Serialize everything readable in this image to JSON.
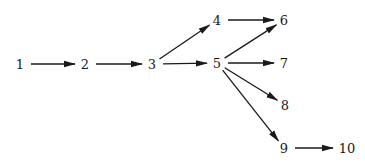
{
  "diagram": {
    "type": "directed-graph",
    "nodes": [
      {
        "id": "1",
        "label": "1",
        "x": 20,
        "y": 64
      },
      {
        "id": "2",
        "label": "2",
        "x": 85,
        "y": 64
      },
      {
        "id": "3",
        "label": "3",
        "x": 152,
        "y": 64
      },
      {
        "id": "4",
        "label": "4",
        "x": 217,
        "y": 20
      },
      {
        "id": "5",
        "label": "5",
        "x": 217,
        "y": 63
      },
      {
        "id": "6",
        "label": "6",
        "x": 284,
        "y": 20
      },
      {
        "id": "7",
        "label": "7",
        "x": 284,
        "y": 63
      },
      {
        "id": "8",
        "label": "8",
        "x": 285,
        "y": 105
      },
      {
        "id": "9",
        "label": "9",
        "x": 284,
        "y": 148
      },
      {
        "id": "10",
        "label": "10",
        "x": 347,
        "y": 148
      }
    ],
    "edges": [
      {
        "from": "1",
        "to": "2"
      },
      {
        "from": "2",
        "to": "3"
      },
      {
        "from": "3",
        "to": "4"
      },
      {
        "from": "3",
        "to": "5"
      },
      {
        "from": "4",
        "to": "6"
      },
      {
        "from": "5",
        "to": "6"
      },
      {
        "from": "5",
        "to": "7"
      },
      {
        "from": "5",
        "to": "8"
      },
      {
        "from": "5",
        "to": "9"
      },
      {
        "from": "9",
        "to": "10"
      }
    ],
    "colors": {
      "line": "#1a1a1a",
      "background": "#ffffff"
    }
  }
}
